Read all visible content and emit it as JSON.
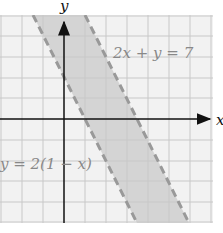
{
  "figure": {
    "axis_labels": {
      "x": "x",
      "y": "y"
    },
    "lines": [
      {
        "equation": "2x + y = 7",
        "style": "dashed"
      },
      {
        "equation": "y = 2(1 − x)",
        "style": "dashed"
      }
    ],
    "shaded_region": "between the two parallel lines",
    "grid": {
      "x_range": [
        -3,
        7
      ],
      "y_range": [
        -5,
        5
      ],
      "step": 1
    },
    "colors": {
      "background": "#f2f2f2",
      "grid": "#c8c8c8",
      "shade": "#d4d4d4",
      "dashed_line": "#999999",
      "axis": "#111111"
    }
  }
}
